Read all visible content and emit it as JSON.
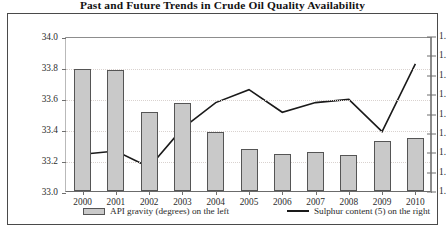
{
  "chart_data": {
    "type": "bar",
    "title": "Past and Future Trends in Crude Oil Quality Availability",
    "xlabel": "",
    "ylabel": "",
    "grid": true,
    "legend_position": "bottom",
    "categories": [
      "2000",
      "2001",
      "2002",
      "2003",
      "2004",
      "2005",
      "2006",
      "2007",
      "2008",
      "2009",
      "2010"
    ],
    "series": [
      {
        "name": "API gravity (degrees) on the left",
        "type": "bar",
        "axis": "left",
        "color": "#c9c9c9",
        "edge_color": "#555555",
        "values": [
          33.79,
          33.78,
          33.51,
          33.57,
          33.38,
          33.27,
          33.24,
          33.25,
          33.23,
          33.32,
          33.34
        ]
      },
      {
        "name": "Sulphur content (5) on the right",
        "type": "line",
        "axis": "right",
        "color": "#1a1a1a",
        "values": [
          1.32,
          1.325,
          1.3,
          1.36,
          1.4,
          1.42,
          1.385,
          1.4,
          1.405,
          1.355,
          1.46
        ]
      }
    ],
    "left_axis": {
      "ylim": [
        33.0,
        34.0
      ],
      "ticks": [
        "33.0",
        "33.2",
        "33.4",
        "33.6",
        "33.8",
        "34.0"
      ],
      "tick_values": [
        33.0,
        33.2,
        33.4,
        33.6,
        33.8,
        34.0
      ]
    },
    "right_axis": {
      "ylim": [
        1.26,
        1.5
      ],
      "note_clipped": "labels truncated at image edge",
      "ticks": [
        "1.",
        "1.",
        "1.",
        "1.",
        "1.",
        "1.",
        "1.",
        "1.",
        "1."
      ],
      "tick_values": [
        1.26,
        1.29,
        1.32,
        1.35,
        1.38,
        1.41,
        1.44,
        1.47,
        1.5
      ]
    }
  },
  "legend": {
    "entries": [
      {
        "label": "API gravity (degrees) on the left",
        "marker": "bar-swatch-icon"
      },
      {
        "label": "Sulphur content (5) on the right",
        "marker": "line-swatch-icon"
      }
    ]
  },
  "footer": {
    "note": ""
  }
}
